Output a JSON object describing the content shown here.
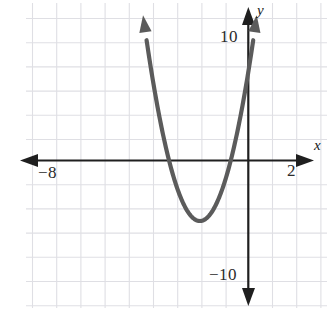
{
  "figure": {
    "background_color": "#ffffff",
    "width": 333,
    "height": 311
  },
  "axis_labels": {
    "x_axis_name": "x",
    "y_axis_name": "y",
    "x_tick_negative": "−8",
    "x_tick_positive": "2",
    "y_tick_positive": "10",
    "y_tick_negative": "−10"
  },
  "colors": {
    "grid": "#dfdfe4",
    "axis": "#1f1f1f",
    "curve": "#5b5b5b",
    "label": "#2b2b2b"
  },
  "chart_data": {
    "type": "line",
    "xlabel": "x",
    "ylabel": "y",
    "grid": true,
    "legend": null,
    "xlim": [
      -9,
      3
    ],
    "ylim": [
      -14,
      12
    ],
    "x_tick_labels": [
      "−8",
      "2"
    ],
    "x_tick_values": [
      -8,
      2
    ],
    "y_tick_labels": [
      "10",
      "−10"
    ],
    "y_tick_values": [
      10,
      -10
    ],
    "x_gridline_step": 1,
    "y_gridline_step": 2,
    "origin_px": [
      248.3,
      160.5
    ],
    "px_per_unit_x": 24.2,
    "px_per_unit_y": 12.1,
    "series": [
      {
        "name": "parabola",
        "equation": "y = 3(x + 2)^2 - 5",
        "vertex": [
          -2,
          -5
        ],
        "opens": "up",
        "x_intercepts": [
          -3.29,
          -0.71
        ],
        "y_intercept": 7,
        "domain_drawn": [
          -4.35,
          0.35
        ],
        "x": [
          -4.35,
          -4.0,
          -3.5,
          -3.29,
          -3.0,
          -2.5,
          -2.0,
          -1.5,
          -1.0,
          -0.71,
          -0.5,
          0.0,
          0.35
        ],
        "y": [
          12.0,
          7.0,
          1.75,
          0.0,
          -2.0,
          -4.25,
          -5.0,
          -4.25,
          -2.0,
          0.0,
          1.75,
          7.0,
          12.0
        ]
      }
    ],
    "annotations": [
      {
        "text": "x",
        "role": "x-axis-name",
        "position": [
          3.1,
          1.3
        ]
      },
      {
        "text": "y",
        "role": "y-axis-name",
        "position": [
          0.5,
          12.4
        ]
      },
      {
        "text": "−8",
        "role": "x-tick",
        "position": [
          -8,
          -1.0
        ]
      },
      {
        "text": "2",
        "role": "x-tick",
        "position": [
          2,
          -1.0
        ]
      },
      {
        "text": "10",
        "role": "y-tick",
        "position": [
          -1.1,
          10
        ]
      },
      {
        "text": "−10",
        "role": "y-tick",
        "position": [
          -1.4,
          -10
        ]
      }
    ]
  }
}
